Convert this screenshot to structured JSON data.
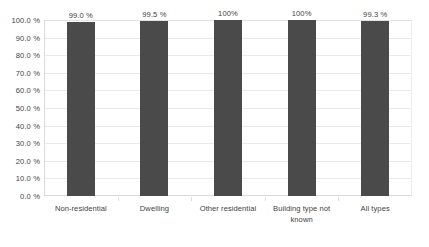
{
  "chart_data": {
    "type": "bar",
    "title": "",
    "subtitle": "",
    "xlabel": "",
    "ylabel": "",
    "categories": [
      "Non-residential",
      "Dwelling",
      "Other residential",
      "Building type not known",
      "All types"
    ],
    "values": [
      99.0,
      99.5,
      100,
      100,
      99.3
    ],
    "data_labels": [
      "99.0 %",
      "99.5 %",
      "100%",
      "100%",
      "99.3 %"
    ],
    "ylim": [
      0,
      100
    ],
    "y_tick_values": [
      100.0,
      90.0,
      80.0,
      70.0,
      60.0,
      50.0,
      40.0,
      30.0,
      20.0,
      10.0,
      0.0
    ],
    "y_tick_labels": [
      "100.0 %",
      "90.0 %",
      "80.0 %",
      "70.0 %",
      "60.0 %",
      "50.0 %",
      "40.0 %",
      "30.0 %",
      "20.0 %",
      "10.0 %",
      "0.0 %"
    ],
    "grid": true,
    "grid_axis": "y",
    "legend": false,
    "legend_position": "none",
    "series": [
      {
        "name": "",
        "values": [
          99.0,
          99.5,
          100,
          100,
          99.3
        ]
      }
    ]
  },
  "style": {
    "bar_color": "#4a4a4a",
    "gridline_color": "#eaeaea",
    "axis_line_color": "#d9d9d9",
    "text_color": "#3f3f3f",
    "background_color": "#ffffff"
  }
}
